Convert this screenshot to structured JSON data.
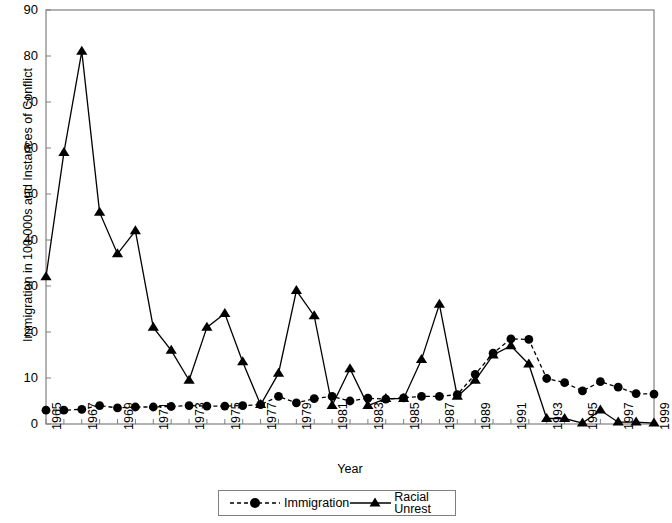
{
  "chart_data": {
    "type": "line",
    "title": "",
    "xlabel": "Year",
    "ylabel": "Immigration in 100,000s and Instances of Conflict",
    "xlim": [
      1965,
      1999
    ],
    "ylim": [
      0,
      90
    ],
    "ytick_step": 10,
    "yticks": [
      0,
      10,
      20,
      30,
      40,
      50,
      60,
      70,
      80,
      90
    ],
    "grid": false,
    "legend_position": "bottom-center",
    "x": [
      1965,
      1966,
      1967,
      1968,
      1969,
      1970,
      1971,
      1972,
      1973,
      1974,
      1975,
      1976,
      1977,
      1978,
      1979,
      1980,
      1981,
      1982,
      1983,
      1984,
      1985,
      1986,
      1987,
      1988,
      1989,
      1990,
      1991,
      1992,
      1993,
      1994,
      1995,
      1996,
      1997,
      1998,
      1999
    ],
    "xtick_labels": [
      "1965",
      "1967",
      "1969",
      "1971",
      "1973",
      "1975",
      "1977",
      "1979",
      "1981",
      "1983",
      "1985",
      "1987",
      "1989",
      "1991",
      "1993",
      "1995",
      "1997",
      "1999"
    ],
    "series": [
      {
        "name": "Immigration",
        "marker": "circle",
        "linestyle": "dashed",
        "color": "#000000",
        "values": [
          3.0,
          3.0,
          3.2,
          4.0,
          3.5,
          3.7,
          3.7,
          3.8,
          4.0,
          3.9,
          3.9,
          4.0,
          4.2,
          6.0,
          4.6,
          5.5,
          6.0,
          5.0,
          5.6,
          5.4,
          5.7,
          6.0,
          6.0,
          6.4,
          10.8,
          15.4,
          18.5,
          18.4,
          9.9,
          9.0,
          7.2,
          9.2,
          8.0,
          6.6,
          6.5
        ]
      },
      {
        "name": "Racial Unrest",
        "marker": "triangle",
        "linestyle": "solid",
        "color": "#000000",
        "values": [
          32.0,
          59.0,
          81.0,
          46.0,
          37.0,
          42.0,
          21.0,
          16.0,
          9.5,
          21.0,
          24.0,
          13.5,
          4.2,
          11.0,
          29.0,
          23.5,
          4.0,
          12.0,
          4.0,
          5.5,
          5.5,
          14.0,
          26.0,
          6.0,
          9.5,
          15.0,
          17.0,
          13.0,
          1.2,
          1.2,
          0.2,
          3.0,
          0.4,
          0.4,
          0.2
        ]
      }
    ]
  },
  "legend": {
    "items": [
      {
        "label": "Immigration",
        "marker": "circle",
        "linestyle": "dashed"
      },
      {
        "label": "Racial Unrest",
        "marker": "triangle",
        "linestyle": "solid"
      }
    ]
  },
  "axes": {
    "x_title": "Year",
    "y_title": "Immigration in 100,000s and Instances of Conflict"
  }
}
